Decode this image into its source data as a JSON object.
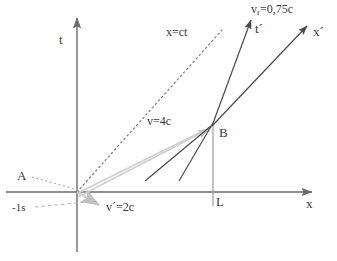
{
  "figure": {
    "background": "#ffffff",
    "width": 337,
    "height": 261
  },
  "colors": {
    "axis": "#6b6b6b",
    "dark_line": "#4a4a4a",
    "gray_line": "#c8c8c8",
    "dotted": "#7a7a7a",
    "text": "#3a3a3a",
    "vertical_drop": "#9a9a9a"
  },
  "labels": {
    "t_axis": "t",
    "x_axis": "x",
    "t_prime_axis": "t´",
    "x_prime_axis": "x´",
    "light_cone": "x=ct",
    "relative_velocity_prefix": "v",
    "relative_velocity_subscript": "r",
    "relative_velocity_value": "=0,75c",
    "relative_velocity_full": "v_r=0,75c",
    "velocity_v": "v=4c",
    "velocity_v_prime": "v´=2c",
    "point_a": "A",
    "point_b": "B",
    "point_l": "L",
    "time_minus_one": "-1s"
  },
  "geometry": {
    "origin": {
      "x": 77,
      "y": 192
    },
    "point_b": {
      "x": 213,
      "y": 124
    },
    "point_l": {
      "x": 213,
      "y": 192
    },
    "t_axis": {
      "x": 77,
      "y_top": 14,
      "y_bottom": 252
    },
    "x_axis": {
      "y": 192,
      "x_left": 6,
      "x_right": 315
    },
    "light_cone_end": {
      "x": 222,
      "y": 30
    },
    "t_prime_tip": {
      "x": 252,
      "y": 18
    },
    "x_prime_tip": {
      "x": 309,
      "y": 24
    },
    "v_prime_arrow_tip": {
      "x": 101,
      "y": 206
    },
    "gray_arrow_to_b_tip": {
      "x": 210,
      "y": 126
    },
    "dark_segment_1": {
      "x1": 145,
      "y1": 180,
      "x2": 211,
      "y2": 126
    },
    "dark_segment_2": {
      "x1": 179,
      "y1": 180,
      "x2": 214,
      "y2": 123
    }
  },
  "label_positions": {
    "t_axis": {
      "x": 59,
      "y": 33
    },
    "x_axis": {
      "x": 306,
      "y": 198
    },
    "t_prime_axis": {
      "x": 255,
      "y": 25
    },
    "x_prime_axis": {
      "x": 313,
      "y": 28
    },
    "light_cone": {
      "x": 166,
      "y": 27
    },
    "relative_velocity": {
      "x": 252,
      "y": 6
    },
    "velocity_v": {
      "x": 148,
      "y": 117
    },
    "velocity_v_prime": {
      "x": 106,
      "y": 203
    },
    "point_a": {
      "x": 18,
      "y": 172
    },
    "point_b": {
      "x": 219,
      "y": 127
    },
    "point_l": {
      "x": 216,
      "y": 196
    },
    "time_minus_one": {
      "x": 13,
      "y": 204
    }
  }
}
